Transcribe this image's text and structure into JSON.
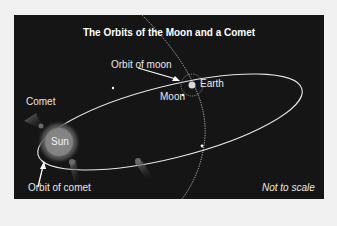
{
  "diagram": {
    "title": "The Orbits of the Moon and a Comet",
    "labels": {
      "orbit_of_moon": "Orbit of moon",
      "earth": "Earth",
      "moon": "Moon",
      "comet": "Comet",
      "sun": "Sun",
      "orbit_of_comet": "Orbit of comet",
      "scale_note": "Not to scale"
    },
    "colors": {
      "background": "#151515",
      "page": "#f1f1f1",
      "orbit_line": "#e6e6e6",
      "sun": "#8a8a8a",
      "text": "#e8e8e8"
    }
  }
}
